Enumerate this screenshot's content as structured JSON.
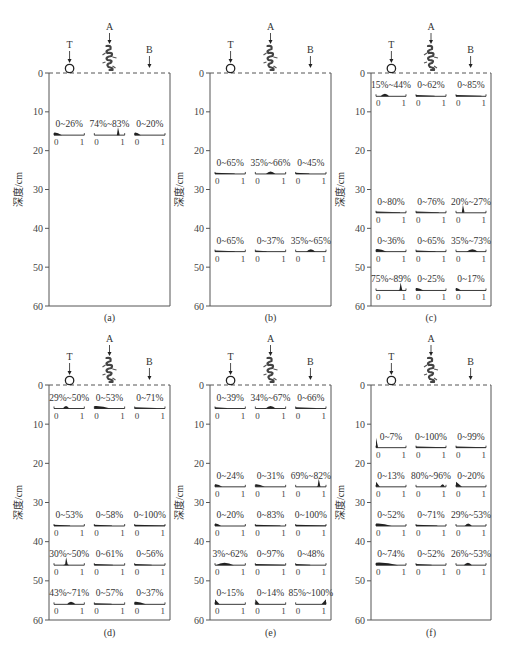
{
  "chart_data": {
    "type": "area",
    "description_labels": {
      "ylabel": "深度/cm",
      "markers": [
        "T",
        "A",
        "B"
      ],
      "y_ticks": [
        0,
        10,
        20,
        30,
        40,
        50,
        60
      ],
      "ylim": [
        0,
        60
      ],
      "sub_axis_ticks": [
        "0",
        "1"
      ]
    },
    "panels": [
      {
        "caption": "(a)",
        "rows": [
          {
            "depth": 16,
            "cells": [
              {
                "col": "T",
                "label": "0~26%",
                "lo": 0.0,
                "hi": 0.26,
                "peak": 0.1,
                "shape": "flat"
              },
              {
                "col": "A",
                "label": "74%~83%",
                "lo": 0.74,
                "hi": 0.83,
                "peak": 0.78,
                "shape": "spike"
              },
              {
                "col": "B",
                "label": "0~20%",
                "lo": 0.0,
                "hi": 0.2,
                "peak": 0.08,
                "shape": "flat"
              }
            ]
          }
        ]
      },
      {
        "caption": "(b)",
        "rows": [
          {
            "depth": 26,
            "cells": [
              {
                "col": "T",
                "label": "0~65%",
                "lo": 0.0,
                "hi": 0.65,
                "peak": 0.3,
                "shape": "line"
              },
              {
                "col": "A",
                "label": "35%~66%",
                "lo": 0.35,
                "hi": 0.66,
                "peak": 0.5,
                "shape": "hump"
              },
              {
                "col": "B",
                "label": "0~45%",
                "lo": 0.0,
                "hi": 0.45,
                "peak": 0.2,
                "shape": "line"
              }
            ]
          },
          {
            "depth": 46,
            "cells": [
              {
                "col": "T",
                "label": "0~65%",
                "lo": 0.0,
                "hi": 0.65,
                "peak": 0.3,
                "shape": "line"
              },
              {
                "col": "A",
                "label": "0~37%",
                "lo": 0.0,
                "hi": 0.37,
                "peak": 0.15,
                "shape": "line"
              },
              {
                "col": "B",
                "label": "35%~65%",
                "lo": 0.35,
                "hi": 0.65,
                "peak": 0.5,
                "shape": "hump"
              }
            ]
          }
        ]
      },
      {
        "caption": "(c)",
        "rows": [
          {
            "depth": 6,
            "cells": [
              {
                "col": "T",
                "label": "15%~44%",
                "lo": 0.15,
                "hi": 0.44,
                "peak": 0.3,
                "shape": "hump"
              },
              {
                "col": "A",
                "label": "0~62%",
                "lo": 0.0,
                "hi": 0.62,
                "peak": 0.3,
                "shape": "line"
              },
              {
                "col": "B",
                "label": "0~85%",
                "lo": 0.0,
                "hi": 0.85,
                "peak": 0.4,
                "shape": "line"
              }
            ]
          },
          {
            "depth": 36,
            "cells": [
              {
                "col": "T",
                "label": "0~80%",
                "lo": 0.0,
                "hi": 0.8,
                "peak": 0.4,
                "shape": "line"
              },
              {
                "col": "A",
                "label": "0~76%",
                "lo": 0.0,
                "hi": 0.76,
                "peak": 0.4,
                "shape": "line"
              },
              {
                "col": "B",
                "label": "20%~27%",
                "lo": 0.2,
                "hi": 0.27,
                "peak": 0.23,
                "shape": "spike"
              }
            ]
          },
          {
            "depth": 46,
            "cells": [
              {
                "col": "T",
                "label": "0~36%",
                "lo": 0.0,
                "hi": 0.36,
                "peak": 0.15,
                "shape": "flat"
              },
              {
                "col": "A",
                "label": "0~65%",
                "lo": 0.0,
                "hi": 0.65,
                "peak": 0.3,
                "shape": "line"
              },
              {
                "col": "B",
                "label": "35%~73%",
                "lo": 0.35,
                "hi": 0.73,
                "peak": 0.55,
                "shape": "hump"
              }
            ]
          },
          {
            "depth": 56,
            "cells": [
              {
                "col": "T",
                "label": "75%~89%",
                "lo": 0.75,
                "hi": 0.89,
                "peak": 0.82,
                "shape": "spike"
              },
              {
                "col": "A",
                "label": "0~25%",
                "lo": 0.0,
                "hi": 0.25,
                "peak": 0.1,
                "shape": "flat"
              },
              {
                "col": "B",
                "label": "0~17%",
                "lo": 0.0,
                "hi": 0.17,
                "peak": 0.05,
                "shape": "flat"
              }
            ]
          }
        ]
      },
      {
        "caption": "(d)",
        "rows": [
          {
            "depth": 6,
            "cells": [
              {
                "col": "T",
                "label": "29%~50%",
                "lo": 0.29,
                "hi": 0.5,
                "peak": 0.4,
                "shape": "hump"
              },
              {
                "col": "A",
                "label": "0~53%",
                "lo": 0.0,
                "hi": 0.53,
                "peak": 0.25,
                "shape": "flat"
              },
              {
                "col": "B",
                "label": "0~71%",
                "lo": 0.0,
                "hi": 0.71,
                "peak": 0.35,
                "shape": "line"
              }
            ]
          },
          {
            "depth": 36,
            "cells": [
              {
                "col": "T",
                "label": "0~53%",
                "lo": 0.0,
                "hi": 0.53,
                "peak": 0.25,
                "shape": "line"
              },
              {
                "col": "A",
                "label": "0~58%",
                "lo": 0.0,
                "hi": 0.58,
                "peak": 0.3,
                "shape": "line"
              },
              {
                "col": "B",
                "label": "0~100%",
                "lo": 0.0,
                "hi": 1.0,
                "peak": 0.5,
                "shape": "line"
              }
            ]
          },
          {
            "depth": 46,
            "cells": [
              {
                "col": "T",
                "label": "30%~50%",
                "lo": 0.3,
                "hi": 0.5,
                "peak": 0.4,
                "shape": "spike"
              },
              {
                "col": "A",
                "label": "0~61%",
                "lo": 0.0,
                "hi": 0.61,
                "peak": 0.3,
                "shape": "line"
              },
              {
                "col": "B",
                "label": "0~56%",
                "lo": 0.0,
                "hi": 0.56,
                "peak": 0.3,
                "shape": "line"
              }
            ]
          },
          {
            "depth": 56,
            "cells": [
              {
                "col": "T",
                "label": "43%~71%",
                "lo": 0.43,
                "hi": 0.71,
                "peak": 0.55,
                "shape": "hump"
              },
              {
                "col": "A",
                "label": "0~57%",
                "lo": 0.0,
                "hi": 0.57,
                "peak": 0.3,
                "shape": "line"
              },
              {
                "col": "B",
                "label": "0~37%",
                "lo": 0.0,
                "hi": 0.37,
                "peak": 0.15,
                "shape": "flat"
              }
            ]
          }
        ]
      },
      {
        "caption": "(e)",
        "rows": [
          {
            "depth": 6,
            "cells": [
              {
                "col": "T",
                "label": "0~39%",
                "lo": 0.0,
                "hi": 0.39,
                "peak": 0.2,
                "shape": "line"
              },
              {
                "col": "A",
                "label": "34%~67%",
                "lo": 0.34,
                "hi": 0.67,
                "peak": 0.5,
                "shape": "hump"
              },
              {
                "col": "B",
                "label": "0~66%",
                "lo": 0.0,
                "hi": 0.66,
                "peak": 0.3,
                "shape": "line"
              }
            ]
          },
          {
            "depth": 26,
            "cells": [
              {
                "col": "T",
                "label": "0~24%",
                "lo": 0.0,
                "hi": 0.24,
                "peak": 0.1,
                "shape": "flat"
              },
              {
                "col": "A",
                "label": "0~31%",
                "lo": 0.0,
                "hi": 0.31,
                "peak": 0.12,
                "shape": "flat"
              },
              {
                "col": "B",
                "label": "69%~82%",
                "lo": 0.69,
                "hi": 0.82,
                "peak": 0.76,
                "shape": "spike"
              }
            ]
          },
          {
            "depth": 36,
            "cells": [
              {
                "col": "T",
                "label": "0~20%",
                "lo": 0.0,
                "hi": 0.2,
                "peak": 0.08,
                "shape": "flat"
              },
              {
                "col": "A",
                "label": "0~83%",
                "lo": 0.0,
                "hi": 0.83,
                "peak": 0.4,
                "shape": "line"
              },
              {
                "col": "B",
                "label": "0~100%",
                "lo": 0.0,
                "hi": 1.0,
                "peak": 0.5,
                "shape": "line"
              }
            ]
          },
          {
            "depth": 46,
            "cells": [
              {
                "col": "T",
                "label": "3%~62%",
                "lo": 0.03,
                "hi": 0.62,
                "peak": 0.3,
                "shape": "hump"
              },
              {
                "col": "A",
                "label": "0~97%",
                "lo": 0.0,
                "hi": 0.97,
                "peak": 0.5,
                "shape": "line"
              },
              {
                "col": "B",
                "label": "0~48%",
                "lo": 0.0,
                "hi": 0.48,
                "peak": 0.2,
                "shape": "line"
              }
            ]
          },
          {
            "depth": 56,
            "cells": [
              {
                "col": "T",
                "label": "0~15%",
                "lo": 0.0,
                "hi": 0.15,
                "peak": 0.0,
                "shape": "left-tri"
              },
              {
                "col": "A",
                "label": "0~14%",
                "lo": 0.0,
                "hi": 0.14,
                "peak": 0.0,
                "shape": "left-tri"
              },
              {
                "col": "B",
                "label": "85%~100%",
                "lo": 0.85,
                "hi": 1.0,
                "peak": 1.0,
                "shape": "right-tri"
              }
            ]
          }
        ]
      },
      {
        "caption": "(f)",
        "rows": [
          {
            "depth": 16,
            "cells": [
              {
                "col": "T",
                "label": "0~7%",
                "lo": 0.0,
                "hi": 0.07,
                "peak": 0.0,
                "shape": "left-tri-tall"
              },
              {
                "col": "A",
                "label": "0~100%",
                "lo": 0.0,
                "hi": 1.0,
                "peak": 0.5,
                "shape": "line"
              },
              {
                "col": "B",
                "label": "0~99%",
                "lo": 0.0,
                "hi": 0.99,
                "peak": 0.5,
                "shape": "line"
              }
            ]
          },
          {
            "depth": 26,
            "cells": [
              {
                "col": "T",
                "label": "0~13%",
                "lo": 0.0,
                "hi": 0.13,
                "peak": 0.0,
                "shape": "left-tri"
              },
              {
                "col": "A",
                "label": "80%~96%",
                "lo": 0.8,
                "hi": 0.96,
                "peak": 0.9,
                "shape": "hump"
              },
              {
                "col": "B",
                "label": "0~20%",
                "lo": 0.0,
                "hi": 0.2,
                "peak": 0.05,
                "shape": "left-tri"
              }
            ]
          },
          {
            "depth": 36,
            "cells": [
              {
                "col": "T",
                "label": "0~52%",
                "lo": 0.0,
                "hi": 0.52,
                "peak": 0.25,
                "shape": "flat"
              },
              {
                "col": "A",
                "label": "0~71%",
                "lo": 0.0,
                "hi": 0.71,
                "peak": 0.35,
                "shape": "line"
              },
              {
                "col": "B",
                "label": "29%~53%",
                "lo": 0.29,
                "hi": 0.53,
                "peak": 0.4,
                "shape": "hump"
              }
            ]
          },
          {
            "depth": 46,
            "cells": [
              {
                "col": "T",
                "label": "0~74%",
                "lo": 0.0,
                "hi": 0.74,
                "peak": 0.35,
                "shape": "flat"
              },
              {
                "col": "A",
                "label": "0~52%",
                "lo": 0.0,
                "hi": 0.52,
                "peak": 0.25,
                "shape": "line"
              },
              {
                "col": "B",
                "label": "26%~53%",
                "lo": 0.26,
                "hi": 0.53,
                "peak": 0.4,
                "shape": "hump"
              }
            ]
          }
        ]
      }
    ]
  },
  "layout": {
    "panel_boxes": [
      {
        "x0": 49,
        "x1": 170,
        "y0": 73,
        "y1": 306,
        "caption_y": 321
      },
      {
        "x0": 210,
        "x1": 331,
        "y0": 73,
        "y1": 306,
        "caption_y": 321
      },
      {
        "x0": 371,
        "x1": 491,
        "y0": 73,
        "y1": 306,
        "caption_y": 321
      },
      {
        "x0": 49,
        "x1": 170,
        "y0": 385,
        "y1": 620,
        "caption_y": 636
      },
      {
        "x0": 210,
        "x1": 331,
        "y0": 385,
        "y1": 620,
        "caption_y": 636
      },
      {
        "x0": 371,
        "x1": 491,
        "y0": 385,
        "y1": 620,
        "caption_y": 636
      }
    ],
    "ink": "#222222",
    "frame": "#555555"
  }
}
